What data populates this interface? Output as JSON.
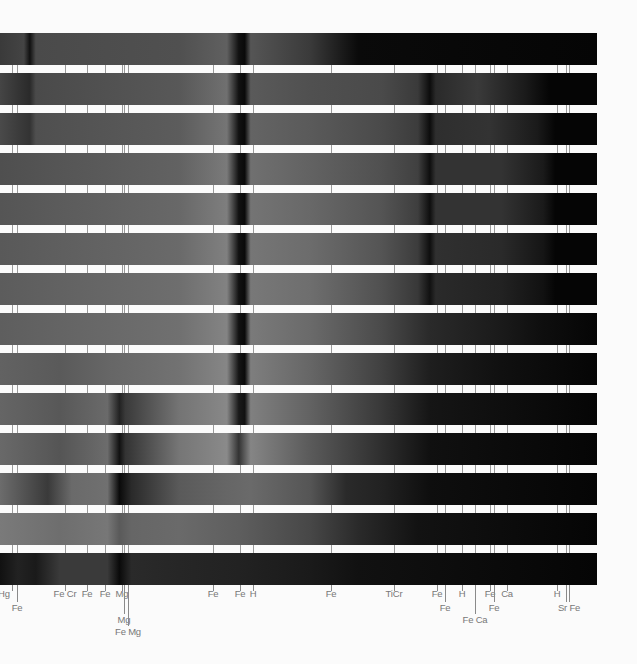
{
  "figure": {
    "title": "",
    "band_count": 14,
    "band_top": 33,
    "band_height": 32,
    "band_period": 40,
    "band_width": 597
  },
  "chart_data": {
    "type": "spectrum_bands",
    "title": "",
    "xlabel": "",
    "ylabel": "",
    "bands": [
      {
        "stops": [
          [
            0,
            "#3a3a3a"
          ],
          [
            4,
            "#444"
          ],
          [
            5,
            "#111"
          ],
          [
            6,
            "#4a4a4a"
          ],
          [
            30,
            "#505050"
          ],
          [
            38,
            "#606060"
          ],
          [
            40,
            "#111"
          ],
          [
            41,
            "#0a0a0a"
          ],
          [
            42,
            "#555"
          ],
          [
            52,
            "#3a3a3a"
          ],
          [
            56,
            "#222"
          ],
          [
            60,
            "#0a0a0a"
          ],
          [
            100,
            "#050505"
          ]
        ]
      },
      {
        "stops": [
          [
            0,
            "#454545"
          ],
          [
            5,
            "#2a2a2a"
          ],
          [
            6,
            "#4a4a4a"
          ],
          [
            30,
            "#585858"
          ],
          [
            38,
            "#707070"
          ],
          [
            40,
            "#111"
          ],
          [
            41,
            "#0a0a0a"
          ],
          [
            42,
            "#5a5a5a"
          ],
          [
            52,
            "#505050"
          ],
          [
            64,
            "#4a4a4a"
          ],
          [
            70,
            "#3a3a3a"
          ],
          [
            72,
            "#0c0c0c"
          ],
          [
            73,
            "#2a2a2a"
          ],
          [
            80,
            "#3a3a3a"
          ],
          [
            88,
            "#1a1a1a"
          ],
          [
            92,
            "#050505"
          ],
          [
            100,
            "#050505"
          ]
        ]
      },
      {
        "stops": [
          [
            0,
            "#4a4a4a"
          ],
          [
            5,
            "#333"
          ],
          [
            6,
            "#4f4f4f"
          ],
          [
            30,
            "#5c5c5c"
          ],
          [
            38,
            "#757575"
          ],
          [
            40,
            "#111"
          ],
          [
            41,
            "#0a0a0a"
          ],
          [
            42,
            "#646464"
          ],
          [
            52,
            "#5a5a5a"
          ],
          [
            64,
            "#4a4a4a"
          ],
          [
            70,
            "#3c3c3c"
          ],
          [
            72,
            "#0c0c0c"
          ],
          [
            73,
            "#2e2e2e"
          ],
          [
            82,
            "#333"
          ],
          [
            90,
            "#1a1a1a"
          ],
          [
            93,
            "#050505"
          ],
          [
            100,
            "#050505"
          ]
        ]
      },
      {
        "stops": [
          [
            0,
            "#4f4f4f"
          ],
          [
            30,
            "#626262"
          ],
          [
            38,
            "#7a7a7a"
          ],
          [
            40,
            "#111"
          ],
          [
            41,
            "#0a0a0a"
          ],
          [
            42,
            "#707070"
          ],
          [
            52,
            "#626262"
          ],
          [
            64,
            "#505050"
          ],
          [
            70,
            "#404040"
          ],
          [
            72,
            "#0e0e0e"
          ],
          [
            73,
            "#333"
          ],
          [
            84,
            "#333"
          ],
          [
            91,
            "#1a1a1a"
          ],
          [
            93,
            "#050505"
          ],
          [
            100,
            "#050505"
          ]
        ]
      },
      {
        "stops": [
          [
            0,
            "#555"
          ],
          [
            30,
            "#686868"
          ],
          [
            38,
            "#7e7e7e"
          ],
          [
            40,
            "#111"
          ],
          [
            41,
            "#0a0a0a"
          ],
          [
            42,
            "#747474"
          ],
          [
            52,
            "#686868"
          ],
          [
            64,
            "#545454"
          ],
          [
            70,
            "#3e3e3e"
          ],
          [
            72,
            "#0e0e0e"
          ],
          [
            73,
            "#333"
          ],
          [
            84,
            "#333"
          ],
          [
            91,
            "#1a1a1a"
          ],
          [
            93,
            "#050505"
          ],
          [
            100,
            "#050505"
          ]
        ]
      },
      {
        "stops": [
          [
            0,
            "#595959"
          ],
          [
            30,
            "#6a6a6a"
          ],
          [
            38,
            "#808080"
          ],
          [
            40,
            "#111"
          ],
          [
            41,
            "#0a0a0a"
          ],
          [
            42,
            "#767676"
          ],
          [
            52,
            "#6c6c6c"
          ],
          [
            64,
            "#545454"
          ],
          [
            70,
            "#3c3c3c"
          ],
          [
            72,
            "#0e0e0e"
          ],
          [
            73,
            "#303030"
          ],
          [
            84,
            "#2a2a2a"
          ],
          [
            91,
            "#151515"
          ],
          [
            93,
            "#050505"
          ],
          [
            100,
            "#050505"
          ]
        ]
      },
      {
        "stops": [
          [
            0,
            "#5c5c5c"
          ],
          [
            30,
            "#6e6e6e"
          ],
          [
            38,
            "#828282"
          ],
          [
            40,
            "#111"
          ],
          [
            41,
            "#0a0a0a"
          ],
          [
            42,
            "#787878"
          ],
          [
            52,
            "#6e6e6e"
          ],
          [
            64,
            "#505050"
          ],
          [
            70,
            "#383838"
          ],
          [
            72,
            "#111"
          ],
          [
            73,
            "#2a2a2a"
          ],
          [
            84,
            "#222"
          ],
          [
            91,
            "#111"
          ],
          [
            93,
            "#050505"
          ],
          [
            100,
            "#050505"
          ]
        ]
      },
      {
        "stops": [
          [
            0,
            "#5e5e5e"
          ],
          [
            30,
            "#707070"
          ],
          [
            38,
            "#848484"
          ],
          [
            40,
            "#111"
          ],
          [
            41,
            "#0a0a0a"
          ],
          [
            42,
            "#7a7a7a"
          ],
          [
            52,
            "#6a6a6a"
          ],
          [
            64,
            "#4a4a4a"
          ],
          [
            72,
            "#2a2a2a"
          ],
          [
            84,
            "#1a1a1a"
          ],
          [
            91,
            "#0e0e0e"
          ],
          [
            100,
            "#050505"
          ]
        ]
      },
      {
        "stops": [
          [
            0,
            "#626262"
          ],
          [
            10,
            "#5a5a5a"
          ],
          [
            18,
            "#666"
          ],
          [
            30,
            "#727272"
          ],
          [
            38,
            "#868686"
          ],
          [
            40,
            "#151515"
          ],
          [
            41,
            "#0a0a0a"
          ],
          [
            42,
            "#7e7e7e"
          ],
          [
            52,
            "#666"
          ],
          [
            64,
            "#404040"
          ],
          [
            72,
            "#1e1e1e"
          ],
          [
            84,
            "#101010"
          ],
          [
            100,
            "#050505"
          ]
        ]
      },
      {
        "stops": [
          [
            0,
            "#656565"
          ],
          [
            10,
            "#585858"
          ],
          [
            18,
            "#6a6a6a"
          ],
          [
            20,
            "#222"
          ],
          [
            21,
            "#3a3a3a"
          ],
          [
            30,
            "#747474"
          ],
          [
            38,
            "#888"
          ],
          [
            40,
            "#1a1a1a"
          ],
          [
            41,
            "#111"
          ],
          [
            42,
            "#808080"
          ],
          [
            52,
            "#626262"
          ],
          [
            64,
            "#383838"
          ],
          [
            72,
            "#151515"
          ],
          [
            100,
            "#050505"
          ]
        ]
      },
      {
        "stops": [
          [
            0,
            "#696969"
          ],
          [
            10,
            "#555"
          ],
          [
            18,
            "#6c6c6c"
          ],
          [
            20,
            "#111"
          ],
          [
            21,
            "#333"
          ],
          [
            30,
            "#767676"
          ],
          [
            38,
            "#8a8a8a"
          ],
          [
            40,
            "#333"
          ],
          [
            42,
            "#858585"
          ],
          [
            52,
            "#5a5a5a"
          ],
          [
            64,
            "#2e2e2e"
          ],
          [
            72,
            "#101010"
          ],
          [
            100,
            "#050505"
          ]
        ]
      },
      {
        "stops": [
          [
            0,
            "#6c6c6c"
          ],
          [
            8,
            "#3a3a3a"
          ],
          [
            12,
            "#6a6a6a"
          ],
          [
            18,
            "#707070"
          ],
          [
            20,
            "#0a0a0a"
          ],
          [
            22,
            "#2a2a2a"
          ],
          [
            30,
            "#5a5a5a"
          ],
          [
            38,
            "#666"
          ],
          [
            42,
            "#6a6a6a"
          ],
          [
            52,
            "#555"
          ],
          [
            58,
            "#2a2a2a"
          ],
          [
            64,
            "#222"
          ],
          [
            72,
            "#0e0e0e"
          ],
          [
            100,
            "#050505"
          ]
        ]
      },
      {
        "stops": [
          [
            0,
            "#7a7a7a"
          ],
          [
            10,
            "#6e6e6e"
          ],
          [
            18,
            "#777"
          ],
          [
            20,
            "#5a5a5a"
          ],
          [
            22,
            "#666"
          ],
          [
            30,
            "#6a6a6a"
          ],
          [
            40,
            "#5e5e5e"
          ],
          [
            52,
            "#474747"
          ],
          [
            60,
            "#2a2a2a"
          ],
          [
            70,
            "#121212"
          ],
          [
            100,
            "#050505"
          ]
        ]
      },
      {
        "stops": [
          [
            0,
            "#111"
          ],
          [
            3,
            "#222"
          ],
          [
            6,
            "#1a1a1a"
          ],
          [
            10,
            "#3a3a3a"
          ],
          [
            18,
            "#3a3a3a"
          ],
          [
            20,
            "#0a0a0a"
          ],
          [
            22,
            "#2a2a2a"
          ],
          [
            30,
            "#262626"
          ],
          [
            40,
            "#222"
          ],
          [
            52,
            "#1a1a1a"
          ],
          [
            60,
            "#111"
          ],
          [
            100,
            "#050505"
          ]
        ]
      }
    ],
    "lines": [
      {
        "x": 12,
        "label": "Hg",
        "row": 0
      },
      {
        "x": 17,
        "label": "Fe",
        "row": 1
      },
      {
        "x": 65,
        "label": "Fe Cr",
        "row": 0
      },
      {
        "x": 87,
        "label": "Fe",
        "row": 0
      },
      {
        "x": 105,
        "label": "Fe",
        "row": 0
      },
      {
        "x": 122,
        "label": "Mg",
        "row": 0
      },
      {
        "x": 124,
        "label": "Mg",
        "row": 2
      },
      {
        "x": 128,
        "label": "Fe Mg",
        "row": 3
      },
      {
        "x": 213,
        "label": "Fe",
        "row": 0
      },
      {
        "x": 240,
        "label": "Fe",
        "row": 0
      },
      {
        "x": 253,
        "label": "H",
        "row": 0
      },
      {
        "x": 331,
        "label": "Fe",
        "row": 0
      },
      {
        "x": 394,
        "label": "TiCr",
        "row": 0
      },
      {
        "x": 437,
        "label": "Fe",
        "row": 0
      },
      {
        "x": 445,
        "label": "Fe",
        "row": 1
      },
      {
        "x": 462,
        "label": "H",
        "row": 0
      },
      {
        "x": 475,
        "label": "Fe Ca",
        "row": 2
      },
      {
        "x": 490,
        "label": "Fe",
        "row": 0
      },
      {
        "x": 494,
        "label": "Fe",
        "row": 1
      },
      {
        "x": 507,
        "label": "Ca",
        "row": 0
      },
      {
        "x": 557,
        "label": "H",
        "row": 0
      },
      {
        "x": 566,
        "label": "",
        "row": 1
      },
      {
        "x": 569,
        "label": "Sr Fe",
        "row": 1
      }
    ]
  }
}
